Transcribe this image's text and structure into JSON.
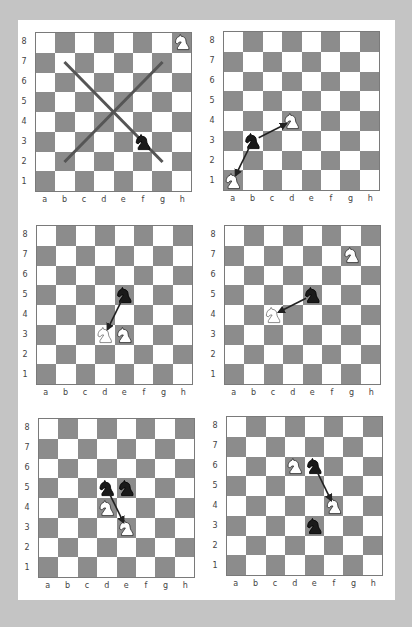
{
  "colors": {
    "background": "#c4c4c4",
    "panel": "#ffffff",
    "dark_square": "#8c8c8c",
    "light_square": "#ffffff",
    "line": "#555555",
    "arrow": "#222222"
  },
  "files": [
    "a",
    "b",
    "c",
    "d",
    "e",
    "f",
    "g",
    "h"
  ],
  "ranks": [
    "8",
    "7",
    "6",
    "5",
    "4",
    "3",
    "2",
    "1"
  ],
  "diagrams": [
    {
      "id": "diagram-1",
      "position": {
        "left": 35,
        "top": 32
      },
      "pieces": [
        {
          "square": "h8",
          "type": "knight",
          "color": "white"
        },
        {
          "square": "f3",
          "type": "knight",
          "color": "black"
        }
      ],
      "lines": [
        {
          "from": "b7",
          "to": "g2",
          "style": "diagonal-line"
        },
        {
          "from": "b2",
          "to": "g7",
          "style": "diagonal-line"
        }
      ],
      "arrows": []
    },
    {
      "id": "diagram-2",
      "position": {
        "left": 223,
        "top": 31
      },
      "pieces": [
        {
          "square": "a1",
          "type": "knight",
          "color": "white"
        },
        {
          "square": "b3",
          "type": "knight",
          "color": "black"
        },
        {
          "square": "d4",
          "type": "knight",
          "color": "white"
        }
      ],
      "lines": [],
      "arrows": [
        {
          "from": "b3",
          "to": "a1"
        },
        {
          "from": "b3",
          "to": "d4"
        }
      ]
    },
    {
      "id": "diagram-3",
      "position": {
        "left": 36,
        "top": 225
      },
      "pieces": [
        {
          "square": "e5",
          "type": "knight",
          "color": "black"
        },
        {
          "square": "d3",
          "type": "knight",
          "color": "white-outline"
        },
        {
          "square": "e3",
          "type": "knight",
          "color": "white"
        }
      ],
      "lines": [],
      "arrows": [
        {
          "from": "e5",
          "to": "d3"
        }
      ]
    },
    {
      "id": "diagram-4",
      "position": {
        "left": 224,
        "top": 225
      },
      "pieces": [
        {
          "square": "g7",
          "type": "knight",
          "color": "white"
        },
        {
          "square": "e5",
          "type": "knight",
          "color": "black"
        },
        {
          "square": "c4",
          "type": "knight",
          "color": "white-outline"
        }
      ],
      "lines": [],
      "arrows": [
        {
          "from": "e5",
          "to": "c4"
        }
      ]
    },
    {
      "id": "diagram-5",
      "position": {
        "left": 38,
        "top": 418
      },
      "pieces": [
        {
          "square": "d5",
          "type": "knight",
          "color": "black"
        },
        {
          "square": "e5",
          "type": "knight",
          "color": "black"
        },
        {
          "square": "d4",
          "type": "knight",
          "color": "white"
        },
        {
          "square": "e3",
          "type": "knight",
          "color": "white"
        }
      ],
      "lines": [],
      "arrows": [
        {
          "from": "d5",
          "to": "e3"
        }
      ]
    },
    {
      "id": "diagram-6",
      "position": {
        "left": 226,
        "top": 416
      },
      "pieces": [
        {
          "square": "d6",
          "type": "knight",
          "color": "white"
        },
        {
          "square": "e6",
          "type": "knight",
          "color": "black"
        },
        {
          "square": "f4",
          "type": "knight",
          "color": "white"
        },
        {
          "square": "e3",
          "type": "knight",
          "color": "black"
        }
      ],
      "lines": [],
      "arrows": [
        {
          "from": "e6",
          "to": "f4"
        }
      ]
    }
  ]
}
